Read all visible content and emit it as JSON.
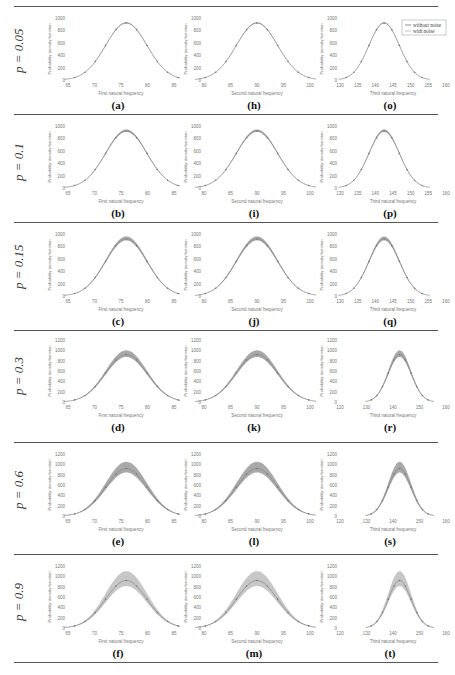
{
  "figure": {
    "legend": {
      "without_noise": "without noise",
      "with_noise": "with noise"
    },
    "ylabel": "Probability density function",
    "footer_text": "Par (Ideal system) ..."
  },
  "rows": [
    {
      "label": "p = 0.05"
    },
    {
      "label": "p = 0.1"
    },
    {
      "label": "p = 0.15"
    },
    {
      "label": "p = 0.3"
    },
    {
      "label": "p = 0.6"
    },
    {
      "label": "p = 0.9"
    }
  ],
  "chart_data": [
    {
      "type": "line",
      "panel": "(a)",
      "noise_level": 0.05,
      "xlabel": "First natural frequency",
      "ylabel": "Probability density function",
      "xticks": [
        65,
        70,
        75,
        80,
        85
      ],
      "yticks": [
        0,
        200,
        400,
        600,
        800,
        1000
      ],
      "ylim": [
        0,
        1000
      ],
      "mean": 76,
      "peak": 920,
      "band": 10
    },
    {
      "type": "line",
      "panel": "(h)",
      "noise_level": 0.05,
      "xlabel": "Second natural frequency",
      "ylabel": "Probability density function",
      "xticks": [
        80,
        85,
        90,
        95,
        100
      ],
      "yticks": [
        0,
        200,
        400,
        600,
        800,
        1000
      ],
      "ylim": [
        0,
        1000
      ],
      "mean": 90,
      "peak": 920,
      "band": 10
    },
    {
      "type": "line",
      "panel": "(o)",
      "noise_level": 0.05,
      "xlabel": "Third natural frequency",
      "ylabel": "Probability density function",
      "xticks": [
        130,
        135,
        140,
        145,
        150,
        155,
        160
      ],
      "yticks": [
        0,
        200,
        400,
        600,
        800,
        1000
      ],
      "ylim": [
        0,
        1000
      ],
      "mean": 142.5,
      "peak": 920,
      "band": 10,
      "legend": [
        "without noise",
        "with noise"
      ]
    },
    {
      "type": "line",
      "panel": "(b)",
      "noise_level": 0.1,
      "xlabel": "First natural frequency",
      "ylabel": "Probability density function",
      "xticks": [
        65,
        70,
        75,
        80,
        85
      ],
      "yticks": [
        0,
        200,
        400,
        600,
        800,
        1000
      ],
      "ylim": [
        0,
        1000
      ],
      "mean": 76,
      "peak": 920,
      "band": 25
    },
    {
      "type": "line",
      "panel": "(i)",
      "noise_level": 0.1,
      "xlabel": "Second natural frequency",
      "ylabel": "Probability density function",
      "xticks": [
        80,
        85,
        90,
        95,
        100
      ],
      "yticks": [
        0,
        200,
        400,
        600,
        800,
        1000
      ],
      "ylim": [
        0,
        1000
      ],
      "mean": 90,
      "peak": 920,
      "band": 25
    },
    {
      "type": "line",
      "panel": "(p)",
      "noise_level": 0.1,
      "xlabel": "Third natural frequency",
      "ylabel": "Probability density function",
      "xticks": [
        130,
        135,
        140,
        145,
        150,
        155,
        160
      ],
      "yticks": [
        0,
        200,
        400,
        600,
        800,
        1000
      ],
      "ylim": [
        0,
        1000
      ],
      "mean": 142.5,
      "peak": 920,
      "band": 25
    },
    {
      "type": "line",
      "panel": "(c)",
      "noise_level": 0.15,
      "xlabel": "First natural frequency",
      "ylabel": "Probability density function",
      "xticks": [
        65,
        70,
        75,
        80,
        85
      ],
      "yticks": [
        0,
        200,
        400,
        600,
        800,
        1000
      ],
      "ylim": [
        0,
        1000
      ],
      "mean": 76,
      "peak": 920,
      "band": 40
    },
    {
      "type": "line",
      "panel": "(j)",
      "noise_level": 0.15,
      "xlabel": "Second natural frequency",
      "ylabel": "Probability density function",
      "xticks": [
        80,
        85,
        90,
        95,
        100
      ],
      "yticks": [
        0,
        200,
        400,
        600,
        800,
        1000
      ],
      "ylim": [
        0,
        1000
      ],
      "mean": 90,
      "peak": 920,
      "band": 40
    },
    {
      "type": "line",
      "panel": "(q)",
      "noise_level": 0.15,
      "xlabel": "Third natural frequency",
      "ylabel": "Probability density function",
      "xticks": [
        130,
        135,
        140,
        145,
        150,
        155,
        160
      ],
      "yticks": [
        0,
        200,
        400,
        600,
        800,
        1000
      ],
      "ylim": [
        0,
        1000
      ],
      "mean": 142.5,
      "peak": 920,
      "band": 40
    },
    {
      "type": "line",
      "panel": "(d)",
      "noise_level": 0.3,
      "xlabel": "First natural frequency",
      "ylabel": "Probability density function",
      "xticks": [
        65,
        70,
        75,
        80,
        85
      ],
      "yticks": [
        0,
        200,
        400,
        600,
        800,
        1000,
        1200
      ],
      "ylim": [
        0,
        1200
      ],
      "mean": 76,
      "peak": 920,
      "band": 80
    },
    {
      "type": "line",
      "panel": "(k)",
      "noise_level": 0.3,
      "xlabel": "Second natural frequency",
      "ylabel": "Probability density function",
      "xticks": [
        80,
        85,
        90,
        95,
        100
      ],
      "yticks": [
        0,
        200,
        400,
        600,
        800,
        1000,
        1200
      ],
      "ylim": [
        0,
        1200
      ],
      "mean": 90,
      "peak": 920,
      "band": 80
    },
    {
      "type": "line",
      "panel": "(r)",
      "noise_level": 0.3,
      "xlabel": "Third natural frequency",
      "ylabel": "Probability density function",
      "xticks": [
        120,
        130,
        140,
        150,
        160
      ],
      "yticks": [
        0,
        200,
        400,
        600,
        800,
        1000,
        1200
      ],
      "ylim": [
        0,
        1200
      ],
      "mean": 142.5,
      "peak": 920,
      "band": 80
    },
    {
      "type": "line",
      "panel": "(e)",
      "noise_level": 0.6,
      "xlabel": "First natural frequency",
      "ylabel": "Probability density function",
      "xticks": [
        65,
        70,
        75,
        80,
        85
      ],
      "yticks": [
        0,
        200,
        400,
        600,
        800,
        1000,
        1200
      ],
      "ylim": [
        0,
        1200
      ],
      "mean": 76,
      "peak": 920,
      "band": 130
    },
    {
      "type": "line",
      "panel": "(l)",
      "noise_level": 0.6,
      "xlabel": "Second natural frequency",
      "ylabel": "Probability density function",
      "xticks": [
        80,
        85,
        90,
        95,
        100
      ],
      "yticks": [
        0,
        200,
        400,
        600,
        800,
        1000,
        1200
      ],
      "ylim": [
        0,
        1200
      ],
      "mean": 90,
      "peak": 920,
      "band": 130
    },
    {
      "type": "line",
      "panel": "(s)",
      "noise_level": 0.6,
      "xlabel": "Third natural frequency",
      "ylabel": "Probability density function",
      "xticks": [
        120,
        130,
        140,
        150,
        160
      ],
      "yticks": [
        0,
        200,
        400,
        600,
        800,
        1000,
        1200
      ],
      "ylim": [
        0,
        1200
      ],
      "mean": 142.5,
      "peak": 920,
      "band": 130
    },
    {
      "type": "line",
      "panel": "(f)",
      "noise_level": 0.9,
      "xlabel": "First natural frequency",
      "ylabel": "Probability density function",
      "xticks": [
        65,
        70,
        75,
        80,
        85
      ],
      "yticks": [
        0,
        200,
        400,
        600,
        800,
        1000,
        1200
      ],
      "ylim": [
        0,
        1200
      ],
      "mean": 76,
      "peak": 920,
      "band": 180
    },
    {
      "type": "line",
      "panel": "(m)",
      "noise_level": 0.9,
      "xlabel": "Second natural frequency",
      "ylabel": "Probability density function",
      "xticks": [
        80,
        85,
        90,
        95,
        100
      ],
      "yticks": [
        0,
        200,
        400,
        600,
        800,
        1000,
        1200
      ],
      "ylim": [
        0,
        1200
      ],
      "mean": 90,
      "peak": 920,
      "band": 180
    },
    {
      "type": "line",
      "panel": "(t)",
      "noise_level": 0.9,
      "xlabel": "Third natural frequency",
      "ylabel": "Probability density function",
      "xticks": [
        120,
        130,
        140,
        150,
        160
      ],
      "yticks": [
        0,
        200,
        400,
        600,
        800,
        1000,
        1200
      ],
      "ylim": [
        0,
        1200
      ],
      "mean": 142.5,
      "peak": 920,
      "band": 180
    }
  ]
}
